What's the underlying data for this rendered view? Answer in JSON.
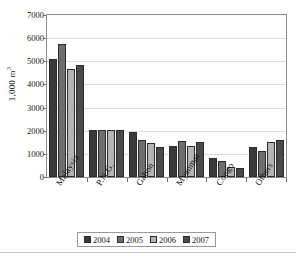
{
  "chart_data": {
    "type": "bar",
    "title": "",
    "subtitle": "",
    "xlabel": "",
    "ylabel": "1,000 m³",
    "ylabel_base": "1,000 m",
    "ylabel_exponent": "3",
    "ylim": [
      0,
      7000
    ],
    "ytick_step": 1000,
    "yticks": [
      0,
      1000,
      2000,
      3000,
      4000,
      5000,
      6000,
      7000
    ],
    "ytick_labels": [
      "0",
      "1000",
      "2000",
      "3000",
      "4000",
      "5000",
      "6000",
      "7000"
    ],
    "grid": true,
    "grid_axis": "y",
    "legend_position": "bottom",
    "categories": [
      "Malaysia",
      "P.N.G.",
      "Gabon",
      "Myanmar",
      "Congo",
      "Others"
    ],
    "series": [
      {
        "name": "2004",
        "color": "#3a3a3a",
        "values": [
          5100,
          2010,
          1950,
          1350,
          830,
          1300
        ]
      },
      {
        "name": "2005",
        "color": "#6e6e6e",
        "values": [
          5750,
          2010,
          1580,
          1560,
          700,
          1120
        ]
      },
      {
        "name": "2006",
        "color": "#b4b4b4",
        "values": [
          4680,
          2010,
          1460,
          1340,
          420,
          1510
        ]
      },
      {
        "name": "2007",
        "color": "#4a4a4a",
        "values": [
          4830,
          2010,
          1280,
          1510,
          400,
          1600
        ]
      }
    ]
  },
  "legend": {
    "items": [
      {
        "label": "2004",
        "color": "#3a3a3a"
      },
      {
        "label": "2005",
        "color": "#6e6e6e"
      },
      {
        "label": "2006",
        "color": "#b4b4b4"
      },
      {
        "label": "2007",
        "color": "#4a4a4a"
      }
    ]
  }
}
